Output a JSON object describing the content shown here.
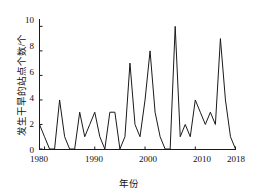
{
  "chart_data": {
    "type": "line",
    "title": "",
    "xlabel": "年份",
    "ylabel": "发生干旱的站点个数/个",
    "xlim": [
      1979,
      2018
    ],
    "ylim": [
      0,
      10.6
    ],
    "xticks": [
      1980,
      1990,
      2000,
      2010,
      2018
    ],
    "yticks": [
      0,
      2,
      4,
      6,
      8,
      10
    ],
    "grid": false,
    "legend": null,
    "line_color": "#1a1a1a",
    "x": [
      1979,
      1980,
      1981,
      1982,
      1983,
      1984,
      1985,
      1986,
      1987,
      1988,
      1989,
      1990,
      1991,
      1992,
      1993,
      1994,
      1995,
      1996,
      1997,
      1998,
      1999,
      2000,
      2001,
      2002,
      2003,
      2004,
      2005,
      2006,
      2007,
      2008,
      2009,
      2010,
      2011,
      2012,
      2013,
      2014,
      2015,
      2016,
      2017,
      2018
    ],
    "values": [
      2,
      1,
      0,
      0,
      4,
      1,
      0,
      0,
      3,
      1,
      2,
      3,
      1,
      0,
      3,
      3,
      0,
      1,
      7,
      2,
      1,
      4,
      8,
      3,
      1,
      0,
      0,
      10,
      1,
      2,
      1,
      4,
      3,
      2,
      3,
      2,
      9,
      4,
      1,
      0
    ],
    "xtick_labels": [
      "1980",
      "1990",
      "2000",
      "2010",
      "2018"
    ],
    "ytick_labels": [
      "0",
      "2",
      "4",
      "6",
      "8",
      "10"
    ]
  }
}
